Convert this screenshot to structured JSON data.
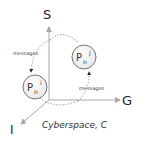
{
  "axes": {
    "s_label": "S",
    "g_label": "G",
    "i_label": "I"
  },
  "nodes": [
    {
      "base": "P",
      "sub": "n",
      "sup": "i"
    },
    {
      "base": "P",
      "sub": "n",
      "sup": "j"
    }
  ],
  "edges": [
    {
      "label": "messages"
    },
    {
      "label": "messages"
    }
  ],
  "caption": "Cyberspace, C",
  "colors": {
    "axis": "#a8a8a8",
    "dotted": "#555555",
    "node_stroke": "#666666",
    "text": "#222222"
  }
}
